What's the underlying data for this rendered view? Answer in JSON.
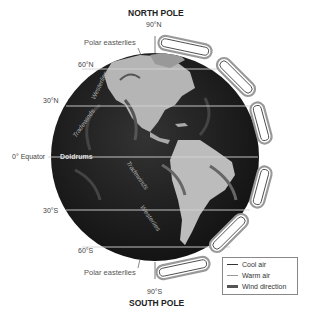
{
  "title_top": "NORTH POLE",
  "title_bottom": "SOUTH POLE",
  "latitudes": {
    "n90": "90°N",
    "n60": "60°N",
    "n30": "30°N",
    "equator": "0° Equator",
    "s30": "30°S",
    "s60": "60°S",
    "s90": "90°S"
  },
  "wind_labels": {
    "polar_easterlies_north": "Polar easterlies",
    "polar_easterlies_south": "Polar easterlies",
    "westerlies_north": "Westerlies",
    "westerlies_south": "Westerlies",
    "tradewinds_north": "Tradewinds",
    "tradewinds_south": "Tradewinds",
    "doldrums": "Doldrums"
  },
  "legend": {
    "items": [
      {
        "label": "Cool air",
        "color": "#333333"
      },
      {
        "label": "Warm air",
        "color": "#999999"
      },
      {
        "label": "Wind direction",
        "color": "#555555"
      }
    ]
  },
  "colors": {
    "globe": "#1e1e1e",
    "land": "#b8b8b8",
    "latitude_line": "#d0d0d0",
    "cell_fill": "#ffffff",
    "cell_stroke": "#888888"
  }
}
